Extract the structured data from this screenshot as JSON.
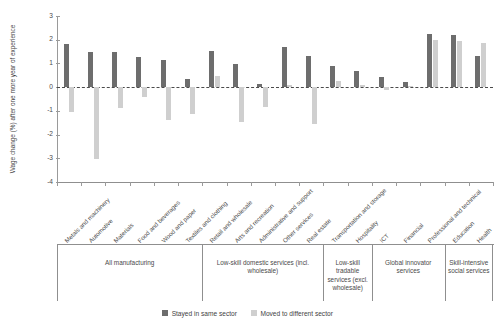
{
  "chart_data": {
    "type": "bar",
    "title": "",
    "xlabel": "",
    "ylabel": "Wage change (%) after one more year of experience",
    "ylim": [
      -4,
      3
    ],
    "yticks": [
      3,
      2,
      1,
      0,
      -1,
      -2,
      -3,
      -4
    ],
    "ytick_labels": [
      "3",
      "2",
      "1",
      "0",
      "-1",
      "-2",
      "-3",
      "-4"
    ],
    "grid": false,
    "legend_position": "bottom",
    "zero_reference_line": true,
    "categories": [
      "Metals and machinery",
      "Automotive",
      "Materials",
      "Food and beverages",
      "Wood and paper",
      "Textiles and clothing",
      "Retail and wholesale",
      "Arts and recreation",
      "Administrative and support",
      "Other services",
      "Real estate",
      "Transportation and storage",
      "Hospitality",
      "ICT",
      "Financial",
      "Professional and technical",
      "Education",
      "Health"
    ],
    "series": [
      {
        "name": "Stayed in same sector",
        "color": "#6d6d6d",
        "values": [
          1.8,
          1.48,
          1.47,
          1.27,
          1.15,
          0.33,
          1.52,
          0.98,
          0.15,
          1.7,
          1.3,
          0.88,
          0.68,
          0.42,
          0.22,
          2.22,
          2.2,
          1.32
        ]
      },
      {
        "name": "Moved to different sector",
        "color": "#cfcfcf",
        "values": [
          -1.05,
          -3.02,
          -0.9,
          -0.42,
          -1.38,
          -1.15,
          0.47,
          -1.45,
          -0.82,
          0.08,
          -1.55,
          0.27,
          0.1,
          -0.1,
          0.05,
          2.0,
          1.95,
          1.85
        ]
      }
    ],
    "groups": [
      {
        "label": "All manufacturing",
        "start": 0,
        "end": 5
      },
      {
        "label": "Low-skill domestic services (incl. wholesale)",
        "start": 6,
        "end": 10
      },
      {
        "label": "Low-skill tradable services (excl. wholesale)",
        "start": 11,
        "end": 12
      },
      {
        "label": "Global innovator services",
        "start": 13,
        "end": 15
      },
      {
        "label": "Skill-intensive social services",
        "start": 16,
        "end": 17
      }
    ]
  },
  "legend": {
    "items": [
      {
        "label": "Stayed in same sector",
        "key": "stay"
      },
      {
        "label": "Moved to different sector",
        "key": "move"
      }
    ]
  }
}
